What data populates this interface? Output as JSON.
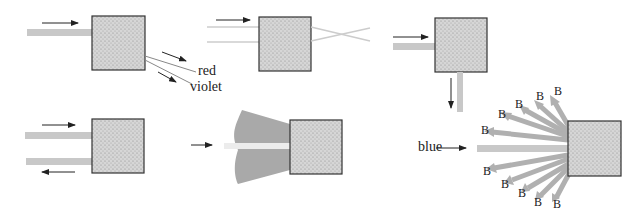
{
  "diagram": {
    "panels": [
      {
        "id": "dispersion",
        "labels": {
          "red": "red",
          "violet": "violet"
        }
      },
      {
        "id": "transmission-crossing"
      },
      {
        "id": "right-angle-scatter"
      },
      {
        "id": "reflection"
      },
      {
        "id": "forward-diffuse-scatter"
      },
      {
        "id": "blue-scattering",
        "labels": {
          "incoming": "blue",
          "scattered": [
            "B",
            "B",
            "B",
            "B",
            "B",
            "B",
            "B",
            "B",
            "B",
            "B",
            "B"
          ]
        }
      }
    ],
    "colors": {
      "beam": "#c8c8c8",
      "box_fill": "#d4d4d4",
      "box_border": "#333333",
      "arrow": "#222222",
      "cone": "#a9a9a9"
    }
  }
}
